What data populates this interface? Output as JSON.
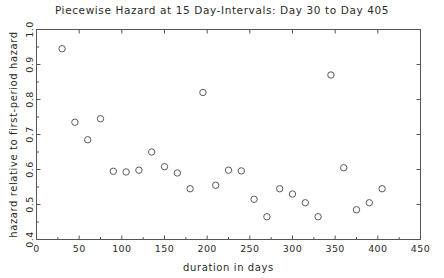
{
  "chart_data": {
    "type": "scatter",
    "title": "Piecewise Hazard at 15 Day-Intervals: Day 30 to Day 405",
    "xlabel": "duration in days",
    "ylabel": "hazard relative to first-period hazard",
    "xlim": [
      0,
      450
    ],
    "ylim": [
      0.4,
      1.0
    ],
    "xticks": [
      0,
      50,
      100,
      150,
      200,
      250,
      300,
      350,
      400,
      450
    ],
    "xtick_labels": [
      "0",
      "50",
      "100",
      "150",
      "200",
      "250",
      "300",
      "350",
      "400",
      "450"
    ],
    "yticks": [
      0.4,
      0.5,
      0.6,
      0.7,
      0.8,
      0.9,
      1.0
    ],
    "ytick_labels": [
      "0.4",
      "0.5",
      "0.6",
      "0.7",
      "0.8",
      "0.9",
      "1.0"
    ],
    "minor_yticks": [
      0.45,
      0.55,
      0.65,
      0.75,
      0.85,
      0.95
    ],
    "grid": false,
    "legend": false,
    "marker": "open-circle",
    "marker_color": "#5a5a5a",
    "x": [
      30,
      45,
      60,
      75,
      90,
      105,
      120,
      135,
      150,
      165,
      180,
      195,
      210,
      225,
      240,
      255,
      270,
      285,
      300,
      315,
      330,
      345,
      360,
      375,
      390,
      405
    ],
    "values": [
      0.945,
      0.735,
      0.685,
      0.745,
      0.595,
      0.593,
      0.598,
      0.65,
      0.608,
      0.59,
      0.545,
      0.82,
      0.555,
      0.598,
      0.596,
      0.515,
      0.465,
      0.545,
      0.53,
      0.505,
      0.465,
      0.87,
      0.605,
      0.485,
      0.505,
      0.545
    ],
    "point_count": 26,
    "interval_days": 15,
    "start_day": 30,
    "end_day": 405
  }
}
